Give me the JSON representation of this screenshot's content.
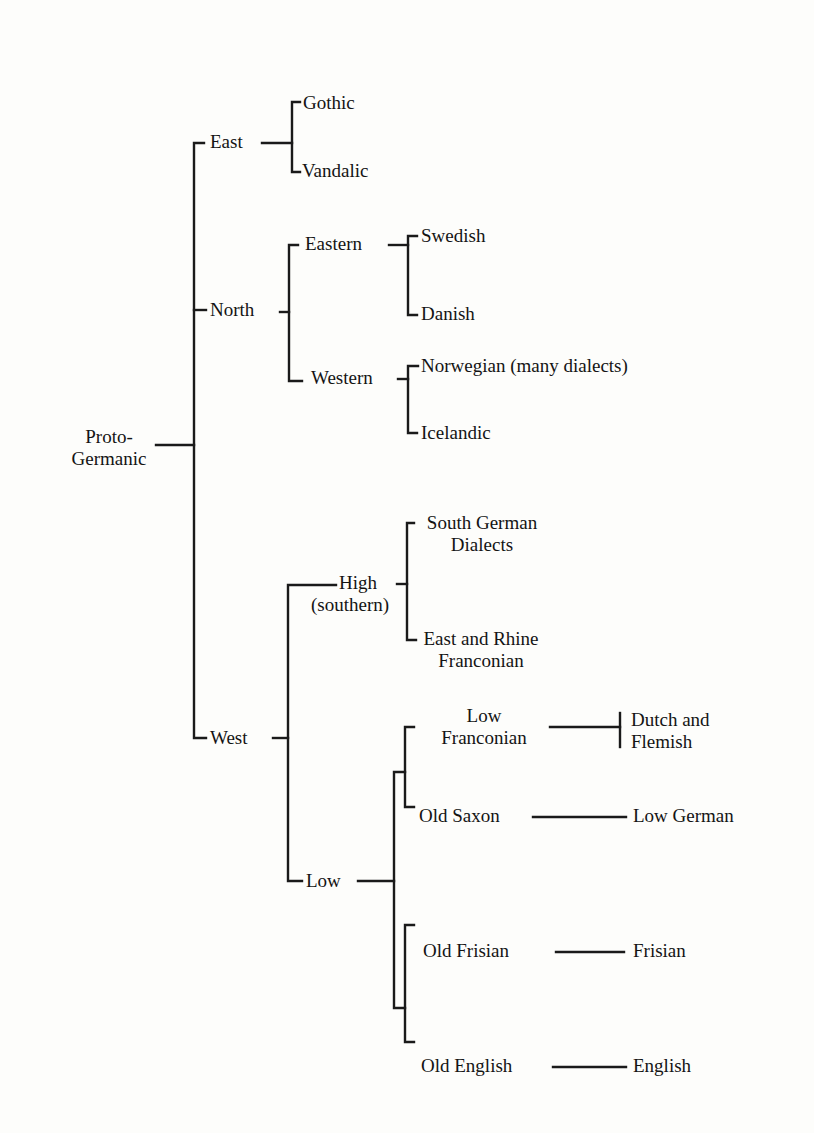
{
  "diagram": {
    "type": "language-family-tree",
    "root": {
      "id": "proto_germanic",
      "line1": "Proto-",
      "line2": "Germanic"
    },
    "nodes": {
      "east": "East",
      "gothic": "Gothic",
      "vandalic": "Vandalic",
      "north": "North",
      "eastern": "Eastern",
      "swedish": "Swedish",
      "danish": "Danish",
      "western": "Western",
      "norwegian": "Norwegian (many dialects)",
      "icelandic": "Icelandic",
      "west": "West",
      "high_line1": "High",
      "high_line2": "(southern)",
      "south_german_line1": "South German",
      "south_german_line2": "Dialects",
      "east_rhine_line1": "East and Rhine",
      "east_rhine_line2": "Franconian",
      "low": "Low",
      "low_franconian_line1": "Low",
      "low_franconian_line2": "Franconian",
      "dutch_line1": "Dutch and",
      "dutch_line2": "Flemish",
      "old_saxon": "Old Saxon",
      "low_german": "Low German",
      "old_frisian": "Old Frisian",
      "frisian": "Frisian",
      "old_english": "Old English",
      "english": "English"
    },
    "edges": [
      [
        "Proto-Germanic",
        "East"
      ],
      [
        "Proto-Germanic",
        "North"
      ],
      [
        "Proto-Germanic",
        "West"
      ],
      [
        "East",
        "Gothic"
      ],
      [
        "East",
        "Vandalic"
      ],
      [
        "North",
        "Eastern"
      ],
      [
        "North",
        "Western"
      ],
      [
        "Eastern",
        "Swedish"
      ],
      [
        "Eastern",
        "Danish"
      ],
      [
        "Western",
        "Norwegian (many dialects)"
      ],
      [
        "Western",
        "Icelandic"
      ],
      [
        "West",
        "High (southern)"
      ],
      [
        "West",
        "Low"
      ],
      [
        "High (southern)",
        "South German Dialects"
      ],
      [
        "High (southern)",
        "East and Rhine Franconian"
      ],
      [
        "Low",
        "Low Franconian"
      ],
      [
        "Low",
        "Old Saxon"
      ],
      [
        "Low",
        "Old Frisian"
      ],
      [
        "Low",
        "Old English"
      ],
      [
        "Low Franconian",
        "Dutch and Flemish"
      ],
      [
        "Old Saxon",
        "Low German"
      ],
      [
        "Old Frisian",
        "Frisian"
      ],
      [
        "Old English",
        "English"
      ]
    ]
  }
}
